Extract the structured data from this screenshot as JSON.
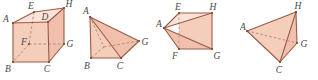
{
  "page": {
    "background_color": "#ffffff",
    "width": 318,
    "height": 80
  },
  "style": {
    "fill_front": "#f4cdbb",
    "fill_top": "#fae3d8",
    "fill_side": "#f0c0ac",
    "fill_flat": "#f5cfbe",
    "edge_color": "#9c5b48",
    "hidden_edge_color": "#b08176",
    "label_color": "#4a4a4a"
  },
  "figures": [
    {
      "id": "figure-1",
      "name": "cube-abcdefgh",
      "shape": "cube",
      "vertices": [
        {
          "label": "E",
          "x": 34,
          "y": 12
        },
        {
          "label": "H",
          "x": 64,
          "y": 8
        },
        {
          "label": "A",
          "x": 13,
          "y": 23
        },
        {
          "label": "D",
          "x": 48,
          "y": 22
        },
        {
          "label": "F",
          "x": 29,
          "y": 44
        },
        {
          "label": "G",
          "x": 64,
          "y": 44
        },
        {
          "label": "B",
          "x": 13,
          "y": 62
        },
        {
          "label": "C",
          "x": 49,
          "y": 62
        }
      ],
      "hidden_vertices": [
        "F"
      ],
      "visible_edges": [
        "A-E",
        "E-H",
        "H-D",
        "D-A",
        "A-B",
        "B-C",
        "C-D",
        "H-G",
        "G-C",
        "E-F_hidden",
        "F-B_hidden",
        "F-G_hidden"
      ]
    },
    {
      "id": "figure-2",
      "name": "pyramid-abcg",
      "shape": "tetrahedron",
      "vertices": [
        {
          "label": "A",
          "x": 12,
          "y": 17
        },
        {
          "label": "G",
          "x": 61,
          "y": 41
        },
        {
          "label": "B",
          "x": 13,
          "y": 58
        },
        {
          "label": "C",
          "x": 43,
          "y": 58
        }
      ],
      "hidden_vertices": [],
      "visible_edges": [
        "A-B",
        "A-C",
        "A-G",
        "B-C",
        "C-G",
        "A-F_hidden",
        "B-G_hidden"
      ]
    },
    {
      "id": "figure-3",
      "name": "pyramid-aefgh",
      "shape": "pyramid",
      "vertices": [
        {
          "label": "E",
          "x": 23,
          "y": 13
        },
        {
          "label": "H",
          "x": 56,
          "y": 13
        },
        {
          "label": "A",
          "x": 8,
          "y": 28
        },
        {
          "label": "F",
          "x": 23,
          "y": 49
        },
        {
          "label": "G",
          "x": 56,
          "y": 49
        }
      ],
      "hidden_vertices": [],
      "visible_edges": [
        "A-E",
        "A-H",
        "A-F",
        "A-G",
        "E-H",
        "H-G",
        "G-F",
        "E-F_hidden"
      ]
    },
    {
      "id": "figure-4",
      "name": "pyramid-achg",
      "shape": "tetrahedron",
      "vertices": [
        {
          "label": "H",
          "x": 56,
          "y": 12
        },
        {
          "label": "A",
          "x": 7,
          "y": 31
        },
        {
          "label": "G",
          "x": 57,
          "y": 43
        },
        {
          "label": "C",
          "x": 40,
          "y": 62
        }
      ],
      "hidden_vertices": [],
      "visible_edges": [
        "A-H",
        "A-C",
        "H-C",
        "H-G",
        "G-C",
        "A-G_hidden"
      ]
    }
  ]
}
